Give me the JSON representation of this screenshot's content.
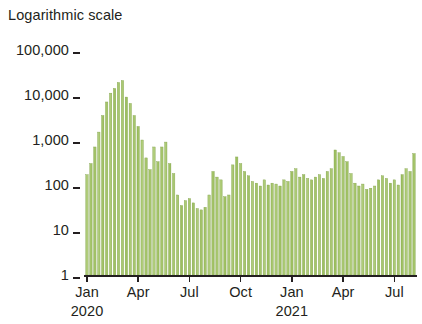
{
  "chart_data": {
    "type": "bar",
    "title": "Logarithmic scale",
    "xlabel": "",
    "ylabel": "",
    "yscale": "log",
    "ylim": [
      1,
      100000
    ],
    "grid": false,
    "legend": null,
    "bar_color": "#9cbe5f",
    "bar_edge_color": "#7d9e45",
    "axis_color": "#231f20",
    "y_ticks": [
      {
        "value": 100000,
        "label": "100,000"
      },
      {
        "value": 10000,
        "label": "10,000"
      },
      {
        "value": 1000,
        "label": "1,000"
      },
      {
        "value": 100,
        "label": "100"
      },
      {
        "value": 10,
        "label": "10"
      },
      {
        "value": 1,
        "label": "1"
      }
    ],
    "x_ticks": [
      {
        "index": 0,
        "label": "Jan",
        "year": "2020"
      },
      {
        "index": 13,
        "label": "Apr",
        "year": ""
      },
      {
        "index": 26,
        "label": "Jul",
        "year": ""
      },
      {
        "index": 39,
        "label": "Oct",
        "year": ""
      },
      {
        "index": 52,
        "label": "Jan",
        "year": "2021"
      },
      {
        "index": 65,
        "label": "Apr",
        "year": ""
      },
      {
        "index": 78,
        "label": "Jul",
        "year": ""
      }
    ],
    "x_unit": "week",
    "x_start": "2020-01",
    "x_end": "2021-08",
    "categories": [
      "2020-W01",
      "2020-W02",
      "2020-W03",
      "2020-W04",
      "2020-W05",
      "2020-W06",
      "2020-W07",
      "2020-W08",
      "2020-W09",
      "2020-W10",
      "2020-W11",
      "2020-W12",
      "2020-W13",
      "2020-W14",
      "2020-W15",
      "2020-W16",
      "2020-W17",
      "2020-W18",
      "2020-W19",
      "2020-W20",
      "2020-W21",
      "2020-W22",
      "2020-W23",
      "2020-W24",
      "2020-W25",
      "2020-W26",
      "2020-W27",
      "2020-W28",
      "2020-W29",
      "2020-W30",
      "2020-W31",
      "2020-W32",
      "2020-W33",
      "2020-W34",
      "2020-W35",
      "2020-W36",
      "2020-W37",
      "2020-W38",
      "2020-W39",
      "2020-W40",
      "2020-W41",
      "2020-W42",
      "2020-W43",
      "2020-W44",
      "2020-W45",
      "2020-W46",
      "2020-W47",
      "2020-W48",
      "2020-W49",
      "2020-W50",
      "2020-W51",
      "2020-W52",
      "2021-W01",
      "2021-W02",
      "2021-W03",
      "2021-W04",
      "2021-W05",
      "2021-W06",
      "2021-W07",
      "2021-W08",
      "2021-W09",
      "2021-W10",
      "2021-W11",
      "2021-W12",
      "2021-W13",
      "2021-W14",
      "2021-W15",
      "2021-W16",
      "2021-W17",
      "2021-W18",
      "2021-W19",
      "2021-W20",
      "2021-W21",
      "2021-W22",
      "2021-W23",
      "2021-W24",
      "2021-W25",
      "2021-W26",
      "2021-W27",
      "2021-W28",
      "2021-W29",
      "2021-W30",
      "2021-W31",
      "2021-W32"
    ],
    "values": [
      170,
      300,
      700,
      1500,
      3500,
      7000,
      11000,
      14000,
      19000,
      21000,
      9000,
      6500,
      3500,
      2000,
      1000,
      400,
      220,
      700,
      330,
      700,
      900,
      300,
      180,
      60,
      35,
      45,
      50,
      40,
      30,
      28,
      32,
      60,
      200,
      150,
      130,
      55,
      60,
      280,
      420,
      300,
      200,
      160,
      120,
      110,
      95,
      130,
      100,
      110,
      105,
      95,
      130,
      120,
      200,
      230,
      150,
      170,
      140,
      130,
      150,
      170,
      140,
      200,
      230,
      600,
      520,
      430,
      330,
      180,
      110,
      95,
      105,
      80,
      85,
      95,
      130,
      160,
      140,
      110,
      130,
      100,
      170,
      230,
      200,
      500
    ]
  }
}
